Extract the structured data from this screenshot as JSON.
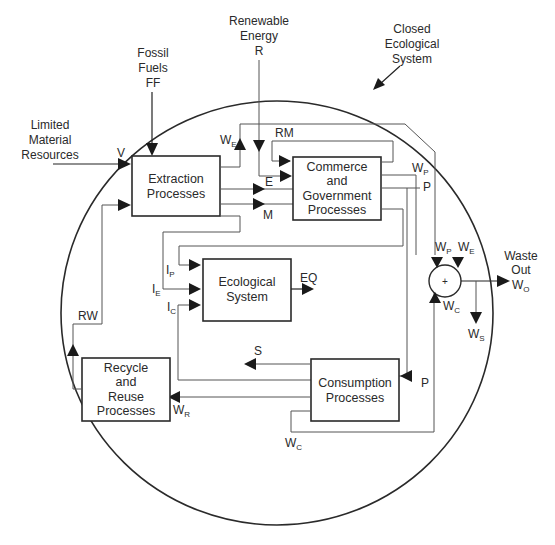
{
  "diagram": {
    "boundary_label": [
      "Closed",
      "Ecological",
      "System"
    ],
    "inputs": {
      "limited_material": {
        "label": [
          "Limited",
          "Material",
          "Resources"
        ],
        "symbol": "V"
      },
      "fossil_fuels": {
        "label": [
          "Fossil",
          "Fuels"
        ],
        "symbol": "FF"
      },
      "renewable_energy": {
        "label": [
          "Renewable",
          "Energy"
        ],
        "symbol": "R"
      }
    },
    "boxes": {
      "extraction": {
        "lines": [
          "Extraction",
          "Processes"
        ]
      },
      "commerce": {
        "lines": [
          "Commerce",
          "and",
          "Government",
          "Processes"
        ]
      },
      "ecological": {
        "lines": [
          "Ecological",
          "System"
        ]
      },
      "consumption": {
        "lines": [
          "Consumption",
          "Processes"
        ]
      },
      "recycle": {
        "lines": [
          "Recycle",
          "and",
          "Reuse",
          "Processes"
        ]
      }
    },
    "flows": {
      "WE": {
        "main": "W",
        "sub": "E"
      },
      "RM": "RM",
      "E": "E",
      "M": "M",
      "WP": {
        "main": "W",
        "sub": "P"
      },
      "P": "P",
      "IP": {
        "main": "I",
        "sub": "P"
      },
      "IE": {
        "main": "I",
        "sub": "E"
      },
      "IC": {
        "main": "I",
        "sub": "C"
      },
      "EQ": "EQ",
      "S": "S",
      "RW": "RW",
      "WR": {
        "main": "W",
        "sub": "R"
      },
      "WC": {
        "main": "W",
        "sub": "C"
      },
      "WS": {
        "main": "W",
        "sub": "S"
      },
      "WO": {
        "main": "W",
        "sub": "O"
      }
    },
    "summing_node": {
      "symbol": "+"
    },
    "waste_out": {
      "label": [
        "Waste",
        "Out"
      ]
    }
  }
}
